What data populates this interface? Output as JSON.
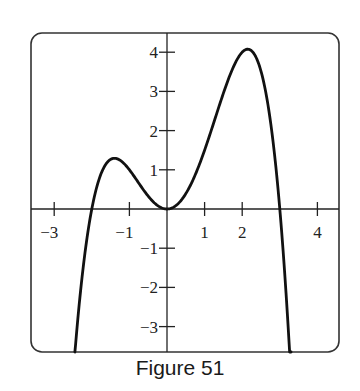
{
  "caption": "Figure 51",
  "chart_data": {
    "type": "line",
    "title": "",
    "caption": "Figure 51",
    "xlabel": "",
    "ylabel": "",
    "xlim": [
      -3.6,
      4.5
    ],
    "ylim": [
      -3.65,
      4.5
    ],
    "grid": false,
    "legend": null,
    "x_ticks": [
      -3,
      -1,
      1,
      2,
      4
    ],
    "x_tick_labels": [
      "−3",
      "−1",
      "1",
      "2",
      "4"
    ],
    "y_ticks": [
      -3,
      -2,
      -1,
      1,
      2,
      3,
      4
    ],
    "y_tick_labels": [
      "−3",
      "−2",
      "−1",
      "1",
      "2",
      "3",
      "4"
    ],
    "series": [
      {
        "name": "f(x)",
        "description": "Quartic curve with roots near x=-2, double root at x=0, and x=3; local max about (-1.4, 1.3), local min (0, 0), global max about (2.1, 4.1); falls to -infinity on both ends",
        "x": [
          -2.45,
          -2.3,
          -2.0,
          -1.8,
          -1.6,
          -1.4,
          -1.2,
          -1.0,
          -0.8,
          -0.6,
          -0.4,
          -0.2,
          0.0,
          0.2,
          0.4,
          0.6,
          0.8,
          1.0,
          1.2,
          1.4,
          1.6,
          1.8,
          2.0,
          2.2,
          2.4,
          2.6,
          2.8,
          3.0,
          3.2,
          3.3
        ],
        "y": [
          -3.68,
          -2.25,
          0.0,
          0.78,
          1.17,
          1.29,
          1.22,
          1.0,
          0.7,
          0.4,
          0.17,
          0.04,
          0.0,
          0.06,
          0.22,
          0.46,
          0.76,
          1.5,
          1.88,
          2.65,
          3.2,
          3.76,
          4.0,
          4.01,
          3.55,
          2.77,
          1.52,
          0.0,
          -1.33,
          -2.2
        ]
      }
    ]
  }
}
